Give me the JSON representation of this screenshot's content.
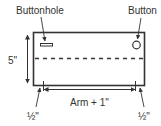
{
  "diagram": {
    "labels": {
      "buttonhole": "Buttonhole",
      "button": "Button",
      "height": "5\"",
      "width": "Arm + 1\"",
      "seam_left": "½\"",
      "seam_right": "½\""
    },
    "colors": {
      "stroke": "#333333",
      "background": "#ffffff"
    }
  }
}
